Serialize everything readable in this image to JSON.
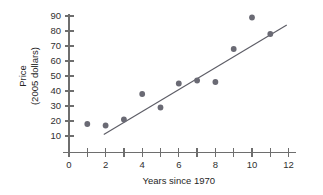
{
  "chart_data": {
    "type": "scatter",
    "title": "",
    "xlabel": "Years since 1970",
    "ylabel": "Price\n(2005 dollars)",
    "ylabel_line1": "Price",
    "ylabel_line2": "(2005 dollars)",
    "x": [
      1,
      2,
      3,
      4,
      5,
      6,
      7,
      8,
      9,
      10,
      11
    ],
    "values": [
      18,
      17,
      21,
      38,
      29,
      45,
      47,
      46,
      68,
      89,
      78
    ],
    "points": [
      {
        "x": 1,
        "y": 18
      },
      {
        "x": 2,
        "y": 17
      },
      {
        "x": 3,
        "y": 21
      },
      {
        "x": 4,
        "y": 38
      },
      {
        "x": 5,
        "y": 29
      },
      {
        "x": 6,
        "y": 45
      },
      {
        "x": 7,
        "y": 47
      },
      {
        "x": 8,
        "y": 46
      },
      {
        "x": 9,
        "y": 68
      },
      {
        "x": 10,
        "y": 89
      },
      {
        "x": 11,
        "y": 78
      }
    ],
    "xlim": [
      0,
      12
    ],
    "ylim": [
      5,
      95
    ],
    "xticks": [
      0,
      1,
      2,
      3,
      4,
      5,
      6,
      7,
      8,
      9,
      10,
      11,
      12
    ],
    "xtick_labels": [
      "0",
      "",
      "2",
      "",
      "4",
      "",
      "6",
      "",
      "8",
      "",
      "10",
      "",
      "12"
    ],
    "yticks": [
      10,
      20,
      30,
      40,
      50,
      60,
      70,
      80,
      90
    ],
    "ytick_labels": [
      "10",
      "20",
      "30",
      "40",
      "50",
      "60",
      "70",
      "80",
      "90"
    ],
    "grid": false,
    "legend": false,
    "trend_line": {
      "label": "line of best fit",
      "x_start": 1.9,
      "y_start": 11,
      "x_end": 11.9,
      "y_end": 84
    },
    "colors": {
      "point": "#6a6a74",
      "line": "#5d5d66",
      "axis": "#6e6e6e",
      "text": "#262626",
      "background": "#ffffff"
    }
  }
}
